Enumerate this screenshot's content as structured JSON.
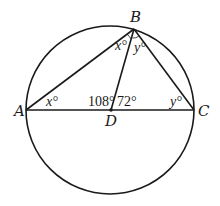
{
  "diagram": {
    "title": "",
    "circle": {
      "cx": 110,
      "cy": 110,
      "r": 84
    },
    "points": {
      "A": {
        "label": "A",
        "x": 26,
        "y": 110
      },
      "B": {
        "label": "B",
        "x": 134,
        "y": 29
      },
      "C": {
        "label": "C",
        "x": 194,
        "y": 110
      },
      "D": {
        "label": "D",
        "x": 111,
        "y": 110
      }
    },
    "segments": [
      [
        "A",
        "B"
      ],
      [
        "B",
        "C"
      ],
      [
        "A",
        "C"
      ],
      [
        "B",
        "D"
      ]
    ],
    "angle_labels": {
      "angle_A": "x°",
      "angle_ABD": "x°",
      "angle_DBC": "y°",
      "angle_C": "y°",
      "angle_ADB": "108°",
      "angle_BDC": "72°"
    },
    "colors": {
      "stroke": "#1a1a1a",
      "background": "#ffffff"
    }
  }
}
